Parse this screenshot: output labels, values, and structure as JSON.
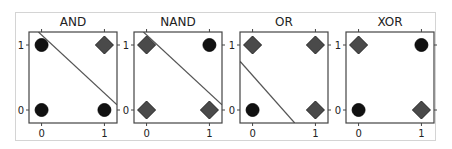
{
  "figure": {
    "frame_color": "#d4d4d4",
    "axis_color": "#444444",
    "text_color": "#222222"
  },
  "chart_data": [
    {
      "type": "scatter",
      "title": "AND",
      "xlim": [
        -0.2,
        1.2
      ],
      "ylim": [
        -0.2,
        1.2
      ],
      "xticks": [
        "0",
        "1"
      ],
      "yticks": [
        "0",
        "1"
      ],
      "points": [
        {
          "x": 0,
          "y": 0,
          "marker": "circle",
          "class": 0
        },
        {
          "x": 0,
          "y": 1,
          "marker": "circle",
          "class": 0
        },
        {
          "x": 1,
          "y": 0,
          "marker": "circle",
          "class": 0
        },
        {
          "x": 1,
          "y": 1,
          "marker": "diamond",
          "class": 1
        }
      ],
      "decision_line": {
        "x1": -0.05,
        "y1": 1.2,
        "x2": 1.2,
        "y2": 0.08
      }
    },
    {
      "type": "scatter",
      "title": "NAND",
      "xlim": [
        -0.2,
        1.2
      ],
      "ylim": [
        -0.2,
        1.2
      ],
      "xticks": [
        "0",
        "1"
      ],
      "yticks": [
        "0",
        "1"
      ],
      "points": [
        {
          "x": 0,
          "y": 0,
          "marker": "diamond",
          "class": 1
        },
        {
          "x": 0,
          "y": 1,
          "marker": "diamond",
          "class": 1
        },
        {
          "x": 1,
          "y": 0,
          "marker": "diamond",
          "class": 1
        },
        {
          "x": 1,
          "y": 1,
          "marker": "circle",
          "class": 0
        }
      ],
      "decision_line": {
        "x1": -0.05,
        "y1": 1.2,
        "x2": 1.2,
        "y2": 0.08
      }
    },
    {
      "type": "scatter",
      "title": "OR",
      "xlim": [
        -0.2,
        1.2
      ],
      "ylim": [
        -0.2,
        1.2
      ],
      "xticks": [
        "0",
        "1"
      ],
      "yticks": [
        "0",
        "1"
      ],
      "points": [
        {
          "x": 0,
          "y": 0,
          "marker": "circle",
          "class": 0
        },
        {
          "x": 0,
          "y": 1,
          "marker": "diamond",
          "class": 1
        },
        {
          "x": 1,
          "y": 0,
          "marker": "diamond",
          "class": 1
        },
        {
          "x": 1,
          "y": 1,
          "marker": "diamond",
          "class": 1
        }
      ],
      "decision_line": {
        "x1": -0.2,
        "y1": 0.75,
        "x2": 0.67,
        "y2": -0.2
      }
    },
    {
      "type": "scatter",
      "title": "XOR",
      "xlim": [
        -0.2,
        1.2
      ],
      "ylim": [
        -0.2,
        1.2
      ],
      "xticks": [
        "0",
        "1"
      ],
      "yticks": [
        "0",
        "1"
      ],
      "points": [
        {
          "x": 0,
          "y": 0,
          "marker": "circle",
          "class": 0
        },
        {
          "x": 0,
          "y": 1,
          "marker": "diamond",
          "class": 1
        },
        {
          "x": 1,
          "y": 0,
          "marker": "diamond",
          "class": 1
        },
        {
          "x": 1,
          "y": 1,
          "marker": "circle",
          "class": 0
        }
      ],
      "decision_line": null
    }
  ],
  "layout": {
    "panels_left": [
      29,
      134,
      240,
      346
    ],
    "panel_top": 32,
    "panel_size": [
      88,
      91
    ]
  }
}
